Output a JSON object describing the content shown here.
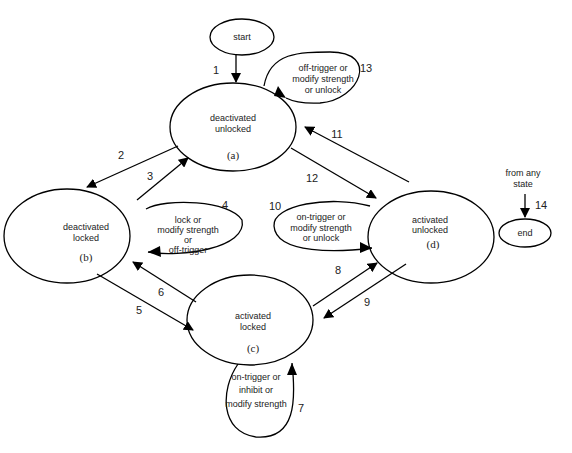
{
  "diagram": {
    "type": "state-transition",
    "nodes": {
      "start": {
        "label": "start"
      },
      "a": {
        "line1": "deactivated",
        "line2": "unlocked",
        "tag": "(a)"
      },
      "b": {
        "line1": "deactivated",
        "line2": "locked",
        "tag": "(b)"
      },
      "c": {
        "line1": "activated",
        "line2": "locked",
        "tag": "(c)"
      },
      "d": {
        "line1": "activated",
        "line2": "unlocked",
        "tag": "(d)"
      },
      "end": {
        "label": "end"
      }
    },
    "self_loops": {
      "loop13": {
        "line1": "off-trigger  or",
        "line2": "modify strength",
        "line3": "or unlock"
      },
      "loop4": {
        "line1": "lock or",
        "line2": "modify strength",
        "line3": "or",
        "line4": "off-trigger"
      },
      "loop10": {
        "line1": "on-trigger  or",
        "line2": "modify strength",
        "line3": "or unlock"
      },
      "loop7": {
        "line1": "on-trigger or",
        "line2": "inhibit or",
        "line3": "modify strength"
      }
    },
    "end_note": {
      "line1": "from any",
      "line2": "state"
    },
    "edge_numbers": {
      "e1": "1",
      "e2": "2",
      "e3": "3",
      "e4": "4",
      "e5": "5",
      "e6": "6",
      "e7": "7",
      "e8": "8",
      "e9": "9",
      "e10": "10",
      "e11": "11",
      "e12": "12",
      "e13": "13",
      "e14": "14"
    }
  }
}
